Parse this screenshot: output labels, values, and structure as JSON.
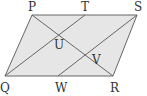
{
  "diagram": {
    "type": "parallelogram-geometry",
    "fill_color": "#e6e6e6",
    "stroke_color": "#666666",
    "label_color": "#333333",
    "points": {
      "P": {
        "label": "P",
        "x": 32,
        "y": 15
      },
      "T": {
        "label": "T",
        "x": 85,
        "y": 15
      },
      "S": {
        "label": "S",
        "x": 137,
        "y": 15
      },
      "Q": {
        "label": "Q",
        "x": 5,
        "y": 76
      },
      "W": {
        "label": "W",
        "x": 58,
        "y": 76
      },
      "R": {
        "label": "R",
        "x": 113,
        "y": 76
      },
      "U": {
        "label": "U",
        "x": 59,
        "y": 35
      },
      "V": {
        "label": "V",
        "x": 87,
        "y": 57
      }
    },
    "segments": [
      [
        "P",
        "S"
      ],
      [
        "S",
        "R"
      ],
      [
        "R",
        "Q"
      ],
      [
        "Q",
        "P"
      ],
      [
        "P",
        "R"
      ],
      [
        "Q",
        "T"
      ],
      [
        "W",
        "S"
      ]
    ],
    "labels": {
      "P": "P",
      "T": "T",
      "S": "S",
      "Q": "Q",
      "W": "W",
      "R": "R",
      "U": "U",
      "V": "V"
    }
  }
}
